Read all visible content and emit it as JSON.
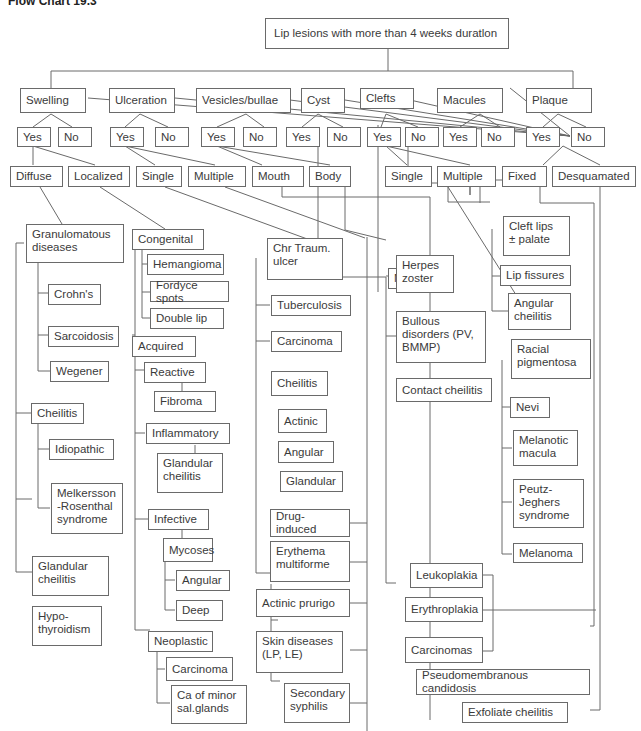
{
  "heading": "Flow Chart 19.3",
  "root": "Lip lesions with more than 4 weeks duratlon",
  "categories": [
    "Swelling",
    "Ulceration",
    "Vesicles/bullae",
    "Cyst",
    "Clefts",
    "Macules",
    "Plaque"
  ],
  "answers": {
    "yes": "Yes",
    "no": "No"
  },
  "level3": {
    "diffuse": "Diffuse",
    "localized": "Localized",
    "single": "Single",
    "multiple": "Multiple",
    "mouth": "Mouth",
    "body": "Body",
    "single2": "Single",
    "multiple2": "Multiple",
    "fixed": "Fixed",
    "desquamated": "Desquamated"
  },
  "swelling_diffuse": {
    "granulomatous": "Granulomatous\ndiseases",
    "granulomatous_children": [
      "Crohn's",
      "Sarcoidosis",
      "Wegener"
    ],
    "cheilitis": "Cheilitis",
    "cheilitis_children": [
      "Idiopathic",
      "Melkersson\n-Rosenthal\nsyndrome"
    ],
    "glandular": "Glandular\ncheilitis",
    "hypothyroidism": "Hypo-\nthyroidism"
  },
  "swelling_localized": {
    "congenital": "Congenital",
    "congenital_children": [
      "Hemangioma",
      "Fordyce spots",
      "Double lip"
    ],
    "acquired": "Acquired",
    "reactive": "Reactive",
    "fibroma": "Fibroma",
    "inflammatory": "Inflammatory",
    "glandular": "Glandular\ncheilitis",
    "infective": "Infective",
    "mycoses": "Mycoses",
    "mycoses_children": [
      "Angular",
      "Deep"
    ],
    "neoplastic": "Neoplastic",
    "neoplastic_children": [
      "Carcinoma",
      "Ca of minor\nsal.glands"
    ]
  },
  "ulceration_single": {
    "items": [
      "Chr Traum.\nulcer",
      "Tuberculosis",
      "Carcinoma",
      "Cheilitis"
    ],
    "cheilitis_children": [
      "Actinic",
      "Angular",
      "Glandular"
    ]
  },
  "ulceration_multiple": [
    "Drug-induced",
    "Erythema\nmultiforme",
    "Actinic prurigo",
    "Skin diseases\n(LP, LE)",
    "Secondary\nsyphilis"
  ],
  "vesicles": {
    "mucocele": "Mucocele",
    "items": [
      "Herpes\nzoster",
      "Bullous\ndisorders (PV,\nBMMP)",
      "Contact cheilitis"
    ]
  },
  "clefts": [
    "Cleft  lips\n± palate",
    "Lip fissures",
    "Angular\ncheilitis"
  ],
  "macules": {
    "racial": "Racial\npigmentosa",
    "items": [
      "Nevi",
      "Melanotic\nmacula",
      "Peutz-\nJeghers\nsyndrome",
      "Melanoma"
    ]
  },
  "plaque_fixed": [
    "Leukoplakia",
    "Erythroplakia",
    "Carcinomas"
  ],
  "plaque_desquamated": [
    "Pseudomembranous candidosis",
    "Exfoliate cheilitis"
  ]
}
